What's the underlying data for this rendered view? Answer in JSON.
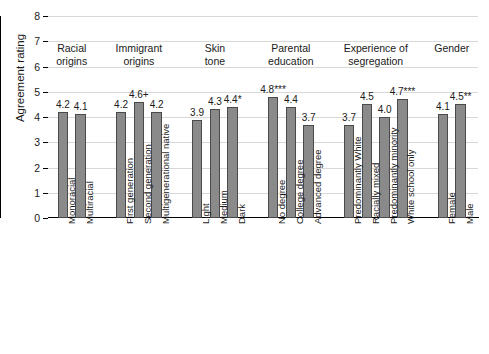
{
  "chart_data": {
    "type": "bar",
    "title": "",
    "xlabel": "",
    "ylabel": "Agreement rating",
    "ylim": [
      0,
      8
    ],
    "ytick_labels": [
      "0",
      "1",
      "2",
      "3",
      "4",
      "5",
      "6",
      "7",
      "8"
    ],
    "grid": true,
    "legend": "none",
    "orientation": "vertical",
    "bar_color": "#8a8a8a",
    "bar_edge_color": "#4a4a4a",
    "groups": [
      {
        "name": "Racial origins",
        "header_line1": "Racial",
        "header_line2": "origins",
        "categories": [
          "Monoracial",
          "Multiracial"
        ],
        "values": [
          4.2,
          4.1
        ],
        "labels": [
          "4.2",
          "4.1"
        ]
      },
      {
        "name": "Immigrant origins",
        "header_line1": "Immigrant",
        "header_line2": "origins",
        "categories": [
          "First generation",
          "Second generation",
          "Multigenerational native"
        ],
        "values": [
          4.2,
          4.6,
          4.2
        ],
        "labels": [
          "4.2",
          "4.6+",
          "4.2"
        ]
      },
      {
        "name": "Skin tone",
        "header_line1": "Skin",
        "header_line2": "tone",
        "categories": [
          "Light",
          "Medium",
          "Dark"
        ],
        "values": [
          3.9,
          4.3,
          4.4
        ],
        "labels": [
          "3.9",
          "4.3",
          "4.4*"
        ]
      },
      {
        "name": "Parental education",
        "header_line1": "Parental",
        "header_line2": "education",
        "categories": [
          "No degree",
          "College degree",
          "Advanced degree"
        ],
        "values": [
          4.8,
          4.4,
          3.7
        ],
        "labels": [
          "4.8***",
          "4.4",
          "3.7"
        ]
      },
      {
        "name": "Experience of segregation",
        "header_line1": "Experience of",
        "header_line2": "segregation",
        "categories": [
          "Predominantly White",
          "Racially mixed",
          "Predominantly minority",
          "White school only"
        ],
        "values": [
          3.7,
          4.5,
          4.0,
          4.7
        ],
        "labels": [
          "3.7",
          "4.5",
          "4.0",
          "4.7***"
        ]
      },
      {
        "name": "Gender",
        "header_line1": "Gender",
        "header_line2": "",
        "categories": [
          "Female",
          "Male"
        ],
        "values": [
          4.1,
          4.5
        ],
        "labels": [
          "4.1",
          "4.5**"
        ]
      }
    ]
  }
}
